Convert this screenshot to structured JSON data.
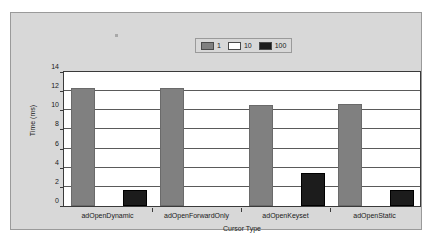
{
  "chart_data": {
    "type": "bar",
    "title": "",
    "xlabel": "Cursor Type",
    "ylabel": "Time (ms)",
    "categories": [
      "adOpenDynamic",
      "adOpenForwardOnly",
      "adOpenKeyset",
      "adOpenStatic"
    ],
    "series": [
      {
        "name": "1",
        "color": "#808080",
        "values": [
          12.3,
          12.3,
          10.6,
          10.7
        ]
      },
      {
        "name": "10",
        "color": "#ffffff",
        "values": [
          0,
          0,
          0,
          0
        ]
      },
      {
        "name": "100",
        "color": "#1c1c1c",
        "values": [
          1.7,
          0,
          3.5,
          1.7
        ]
      }
    ],
    "ylim": [
      0,
      14
    ],
    "yticks": [
      0,
      2,
      4,
      6,
      8,
      10,
      12,
      14
    ],
    "ytick_labels": [
      "0",
      "2",
      "4",
      "6",
      "8",
      "10",
      "12",
      "14"
    ],
    "grid": true,
    "legend_position": "top-center",
    "legend_entries": [
      "1",
      "10",
      "100"
    ],
    "background_color": "#d8d8d8",
    "plot_background_color": "#ffffff",
    "axis_color": "#3a3a3a",
    "gridline_color": "#5a5a5a"
  }
}
